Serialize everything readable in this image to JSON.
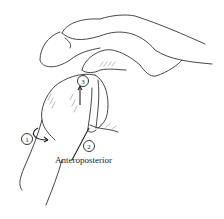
{
  "figure": {
    "caption": "Anteroposterior",
    "labels": [
      {
        "id": "1",
        "text": "1"
      },
      {
        "id": "2",
        "text": "2"
      },
      {
        "id": "3",
        "text": "3"
      }
    ]
  }
}
